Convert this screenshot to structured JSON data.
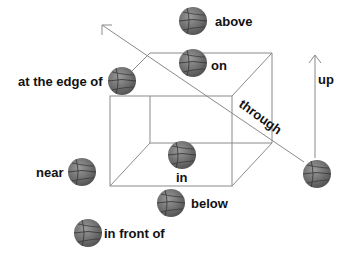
{
  "labels": {
    "above": "above",
    "on": "on",
    "at_the_edge_of": "at the edge of",
    "through": "through",
    "up": "up",
    "in": "in",
    "near": "near",
    "below": "below",
    "in_front_of": "in front of"
  },
  "colors": {
    "line": "#8a8a8a",
    "ball": "#6e6e6e",
    "text": "#111111"
  }
}
